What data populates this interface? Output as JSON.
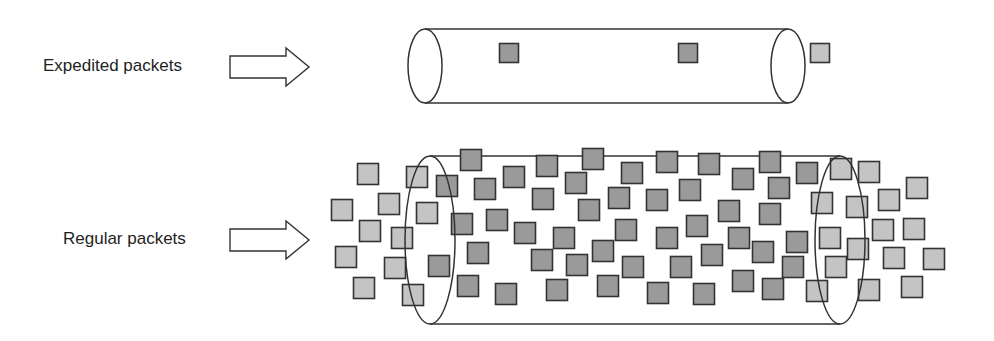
{
  "rows": [
    {
      "label": "Expedited packets",
      "arrow": {
        "x1": 230,
        "x2": 309,
        "cy": 67,
        "shaft_h": 22,
        "head_h": 38,
        "head_x": 286
      },
      "pipe": {
        "left_cx": 425,
        "right_cx": 788,
        "cy": 66,
        "rx": 17,
        "ry": 37
      },
      "packet_size": 19,
      "packets": [
        {
          "x": 509,
          "y": 53,
          "tone": "dark"
        },
        {
          "x": 688,
          "y": 53,
          "tone": "dark"
        },
        {
          "x": 820,
          "y": 53,
          "tone": "light"
        }
      ]
    },
    {
      "label": "Regular packets",
      "arrow": {
        "x1": 230,
        "x2": 309,
        "cy": 240,
        "shaft_h": 22,
        "head_h": 38,
        "head_x": 286
      },
      "pipe": {
        "left_cx": 430,
        "right_cx": 840,
        "cy": 240,
        "rx": 25,
        "ry": 84
      },
      "packet_size": 21,
      "packets": [
        {
          "x": 368,
          "y": 174,
          "tone": "light"
        },
        {
          "x": 417,
          "y": 177,
          "tone": "light"
        },
        {
          "x": 447,
          "y": 186,
          "tone": "dark"
        },
        {
          "x": 471,
          "y": 160,
          "tone": "dark"
        },
        {
          "x": 485,
          "y": 189,
          "tone": "dark"
        },
        {
          "x": 342,
          "y": 210,
          "tone": "light"
        },
        {
          "x": 389,
          "y": 204,
          "tone": "light"
        },
        {
          "x": 427,
          "y": 213,
          "tone": "light"
        },
        {
          "x": 462,
          "y": 224,
          "tone": "dark"
        },
        {
          "x": 497,
          "y": 220,
          "tone": "dark"
        },
        {
          "x": 370,
          "y": 231,
          "tone": "light"
        },
        {
          "x": 402,
          "y": 238,
          "tone": "light"
        },
        {
          "x": 346,
          "y": 257,
          "tone": "light"
        },
        {
          "x": 395,
          "y": 268,
          "tone": "light"
        },
        {
          "x": 439,
          "y": 266,
          "tone": "dark"
        },
        {
          "x": 478,
          "y": 253,
          "tone": "dark"
        },
        {
          "x": 364,
          "y": 288,
          "tone": "light"
        },
        {
          "x": 413,
          "y": 295,
          "tone": "light"
        },
        {
          "x": 468,
          "y": 286,
          "tone": "dark"
        },
        {
          "x": 547,
          "y": 166,
          "tone": "dark"
        },
        {
          "x": 593,
          "y": 159,
          "tone": "dark"
        },
        {
          "x": 632,
          "y": 173,
          "tone": "dark"
        },
        {
          "x": 514,
          "y": 177,
          "tone": "dark"
        },
        {
          "x": 576,
          "y": 183,
          "tone": "dark"
        },
        {
          "x": 543,
          "y": 199,
          "tone": "dark"
        },
        {
          "x": 619,
          "y": 198,
          "tone": "dark"
        },
        {
          "x": 589,
          "y": 210,
          "tone": "dark"
        },
        {
          "x": 525,
          "y": 233,
          "tone": "dark"
        },
        {
          "x": 564,
          "y": 238,
          "tone": "dark"
        },
        {
          "x": 626,
          "y": 230,
          "tone": "dark"
        },
        {
          "x": 603,
          "y": 251,
          "tone": "dark"
        },
        {
          "x": 542,
          "y": 260,
          "tone": "dark"
        },
        {
          "x": 577,
          "y": 265,
          "tone": "dark"
        },
        {
          "x": 633,
          "y": 267,
          "tone": "dark"
        },
        {
          "x": 506,
          "y": 294,
          "tone": "dark"
        },
        {
          "x": 557,
          "y": 290,
          "tone": "dark"
        },
        {
          "x": 608,
          "y": 286,
          "tone": "dark"
        },
        {
          "x": 667,
          "y": 162,
          "tone": "dark"
        },
        {
          "x": 709,
          "y": 164,
          "tone": "dark"
        },
        {
          "x": 770,
          "y": 162,
          "tone": "dark"
        },
        {
          "x": 807,
          "y": 173,
          "tone": "dark"
        },
        {
          "x": 743,
          "y": 179,
          "tone": "dark"
        },
        {
          "x": 690,
          "y": 190,
          "tone": "dark"
        },
        {
          "x": 779,
          "y": 188,
          "tone": "dark"
        },
        {
          "x": 657,
          "y": 200,
          "tone": "dark"
        },
        {
          "x": 729,
          "y": 211,
          "tone": "dark"
        },
        {
          "x": 770,
          "y": 214,
          "tone": "dark"
        },
        {
          "x": 697,
          "y": 226,
          "tone": "dark"
        },
        {
          "x": 667,
          "y": 238,
          "tone": "dark"
        },
        {
          "x": 739,
          "y": 238,
          "tone": "dark"
        },
        {
          "x": 797,
          "y": 242,
          "tone": "dark"
        },
        {
          "x": 712,
          "y": 255,
          "tone": "dark"
        },
        {
          "x": 763,
          "y": 252,
          "tone": "dark"
        },
        {
          "x": 681,
          "y": 267,
          "tone": "dark"
        },
        {
          "x": 793,
          "y": 267,
          "tone": "dark"
        },
        {
          "x": 743,
          "y": 281,
          "tone": "dark"
        },
        {
          "x": 658,
          "y": 293,
          "tone": "dark"
        },
        {
          "x": 704,
          "y": 294,
          "tone": "dark"
        },
        {
          "x": 773,
          "y": 289,
          "tone": "dark"
        },
        {
          "x": 841,
          "y": 169,
          "tone": "light"
        },
        {
          "x": 869,
          "y": 172,
          "tone": "light"
        },
        {
          "x": 917,
          "y": 188,
          "tone": "light"
        },
        {
          "x": 822,
          "y": 203,
          "tone": "light"
        },
        {
          "x": 857,
          "y": 207,
          "tone": "light"
        },
        {
          "x": 889,
          "y": 200,
          "tone": "light"
        },
        {
          "x": 883,
          "y": 230,
          "tone": "light"
        },
        {
          "x": 914,
          "y": 229,
          "tone": "light"
        },
        {
          "x": 830,
          "y": 238,
          "tone": "light"
        },
        {
          "x": 858,
          "y": 249,
          "tone": "light"
        },
        {
          "x": 894,
          "y": 258,
          "tone": "light"
        },
        {
          "x": 934,
          "y": 259,
          "tone": "light"
        },
        {
          "x": 836,
          "y": 267,
          "tone": "light"
        },
        {
          "x": 817,
          "y": 291,
          "tone": "light"
        },
        {
          "x": 869,
          "y": 290,
          "tone": "light"
        },
        {
          "x": 912,
          "y": 287,
          "tone": "light"
        }
      ]
    }
  ],
  "colors": {
    "dark_fill": "#9a9a9a",
    "light_fill": "#c4c4c4",
    "stroke": "#333333",
    "text": "#1e1e1e"
  }
}
